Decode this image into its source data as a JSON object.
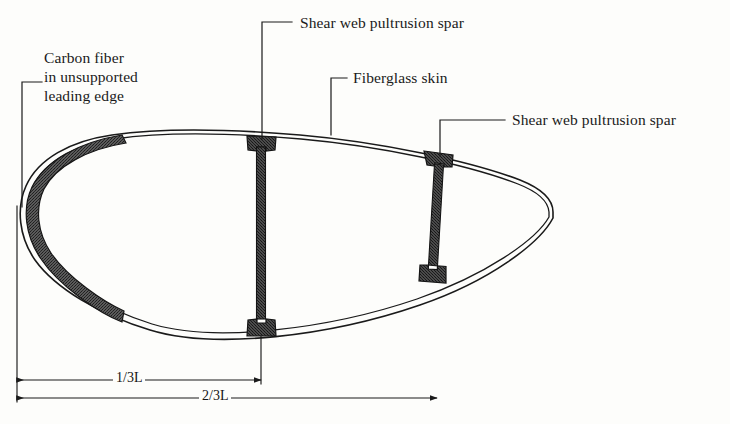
{
  "figure": {
    "background_color": "#fdfdfb",
    "ink_color": "#1a1a1a"
  },
  "labels": {
    "carbon_fiber": "Carbon fiber\nin unsupported\nleading edge",
    "carbon_fiber_lines": [
      "Carbon fiber",
      "in unsupported",
      "leading edge"
    ],
    "shear_web_spar_1": "Shear web pultrusion spar",
    "fiberglass_skin": "Fiberglass skin",
    "shear_web_spar_2": "Shear web pultrusion spar"
  },
  "dimensions": {
    "inner": "1/3L",
    "outer": "2/3L"
  },
  "components": {
    "skin_label": "fiberglass-skin",
    "carbon_label": "carbon-fiber-layer",
    "spar_1_label": "shear-web-pultrusion-spar-1",
    "spar_2_label": "shear-web-pultrusion-spar-2"
  },
  "colors": {
    "outline": "#1a1a1a",
    "hatch_fill": "#4a4a4a",
    "spar_fill": "#555555",
    "paper": "#fdfdfb"
  }
}
